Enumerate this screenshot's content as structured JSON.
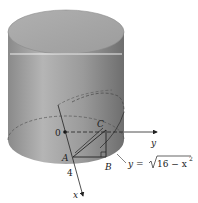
{
  "figure": {
    "labels": {
      "origin": "0",
      "y_axis": "y",
      "x_axis": "x",
      "point_A": "A",
      "point_B": "B",
      "point_C": "C",
      "radius_tick": "4",
      "equation_lhs": "y = ",
      "equation_radicand": "16 − x",
      "equation_exponent": "2"
    },
    "colors": {
      "cylinder_side": "#8e8e8e",
      "cylinder_top": "#a8a8a8",
      "highlight": "#e8e8e8",
      "lines": "#222222",
      "background": "#ffffff"
    }
  }
}
